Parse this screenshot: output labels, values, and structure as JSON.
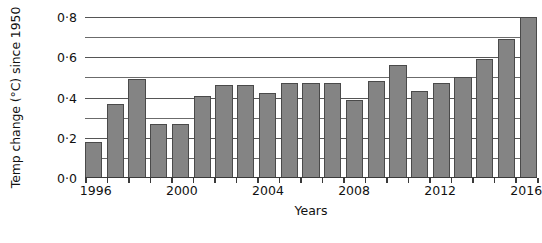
{
  "chart_data": {
    "type": "bar",
    "title": "",
    "xlabel": "Years",
    "ylabel": "Temp change (°C) since 1950",
    "categories": [
      1996,
      1997,
      1998,
      1999,
      2000,
      2001,
      2002,
      2003,
      2004,
      2005,
      2006,
      2007,
      2008,
      2009,
      2010,
      2011,
      2012,
      2013,
      2014,
      2015,
      2016
    ],
    "values": [
      0.18,
      0.37,
      0.49,
      0.27,
      0.27,
      0.41,
      0.46,
      0.46,
      0.42,
      0.47,
      0.47,
      0.47,
      0.39,
      0.48,
      0.56,
      0.43,
      0.47,
      0.5,
      0.59,
      0.69,
      0.8
    ],
    "ylim": [
      0.0,
      0.8
    ],
    "ytick_values": [
      0.0,
      0.1,
      0.2,
      0.3,
      0.4,
      0.5,
      0.6,
      0.7,
      0.8
    ],
    "ytick_labels": [
      "0·0",
      "",
      "0·2",
      "",
      "0·4",
      "",
      "0·6",
      "",
      "0·8"
    ],
    "xtick_values": [
      1996,
      2000,
      2004,
      2008,
      2012,
      2016
    ],
    "xtick_labels": [
      "1996",
      "2000",
      "2004",
      "2008",
      "2012",
      "2016"
    ],
    "grid": true,
    "legend": false,
    "bar_color": "#848484",
    "bar_edge_color": "#4a4a4a",
    "grid_color": "#555555",
    "axis_color": "#3a3a3a"
  }
}
